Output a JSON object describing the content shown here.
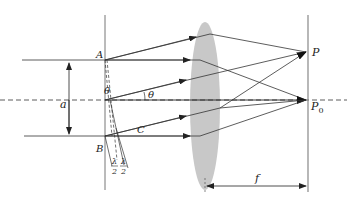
{
  "diagram": {
    "labels": {
      "A": "A",
      "B": "B",
      "C": "C",
      "P": "P",
      "P0_main": "P",
      "P0_sub": "0",
      "a": "a",
      "theta_slit": "θ",
      "theta_ray": "θ",
      "f": "f",
      "lambda": "λ",
      "two": "2"
    },
    "colors": {
      "line": "#333333",
      "lens": "#c8c8c8",
      "screen": "#888888"
    }
  }
}
